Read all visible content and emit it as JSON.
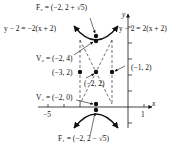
{
  "diagram": {
    "type": "hyperbola",
    "center": {
      "label": "(−2, 2)",
      "x": -2,
      "y": 2
    },
    "focus_upper": {
      "label": "F₂ = (−2, 2 + √5)"
    },
    "focus_lower": {
      "label": "F₁ = (−2, 2 − √5)"
    },
    "vertex_upper": {
      "label": "V₂ = (−2, 4)"
    },
    "vertex_lower": {
      "label": "V₁ = (−2, 0)"
    },
    "point_left": {
      "label": "(−3, 2)"
    },
    "point_right": {
      "label": "(−1, 2)"
    },
    "asymptote_left": {
      "label": "y − 2 = −2(x + 2)"
    },
    "asymptote_right": {
      "label": "y − 2 = 2(x + 2)"
    },
    "axes": {
      "x_label": "x",
      "y_label": "y",
      "x_tick_labels": [
        "−5",
        "1"
      ]
    }
  }
}
